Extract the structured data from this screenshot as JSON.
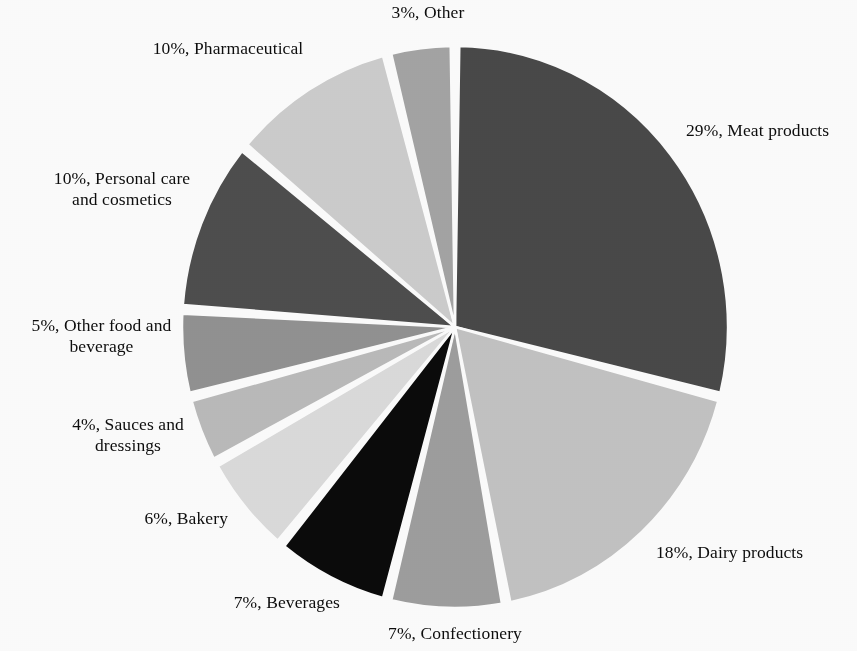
{
  "chart_data": {
    "type": "pie",
    "title": "",
    "subtitle": "",
    "xlabel": "",
    "ylabel": "",
    "legend_position": "none",
    "labels_outside": true,
    "label_format": "{percent}%, {category}",
    "start_angle_deg": 0,
    "direction": "clockwise",
    "categories": [
      "Meat products",
      "Dairy products",
      "Confectionery",
      "Beverages",
      "Bakery",
      "Sauces and dressings",
      "Other food and beverage",
      "Personal care and cosmetics",
      "Pharmaceutical",
      "Other"
    ],
    "values": [
      29,
      18,
      7,
      7,
      6,
      4,
      5,
      10,
      10,
      3
    ],
    "units": "percent",
    "total": 99,
    "slices": [
      {
        "index": 0,
        "category": "Meat products",
        "value": 29,
        "label": "29%, Meat products",
        "color": "#4a4a4a",
        "start_deg": 0,
        "end_deg": 104.4
      },
      {
        "index": 1,
        "category": "Dairy products",
        "value": 18,
        "label": "18%, Dairy products",
        "color": "#c5c5c5",
        "start_deg": 104.4,
        "end_deg": 169.2
      },
      {
        "index": 2,
        "category": "Confectionery",
        "value": 7,
        "label": "7%, Confectionery",
        "color": "#a0a0a0",
        "start_deg": 169.2,
        "end_deg": 194.4
      },
      {
        "index": 3,
        "category": "Beverages",
        "value": 7,
        "label": "7%, Beverages",
        "color": "#0b0b0b",
        "start_deg": 194.4,
        "end_deg": 219.6
      },
      {
        "index": 4,
        "category": "Bakery",
        "value": 6,
        "label": "6%, Bakery",
        "color": "#dedede",
        "start_deg": 219.6,
        "end_deg": 241.2
      },
      {
        "index": 5,
        "category": "Sauces and dressings",
        "value": 4,
        "label": "4%, Sauces and dressings",
        "color": "#bdbdbd",
        "start_deg": 241.2,
        "end_deg": 255.6
      },
      {
        "index": 6,
        "category": "Other food and beverage",
        "value": 5,
        "label": "5%, Other food and beverage",
        "color": "#949494",
        "start_deg": 255.6,
        "end_deg": 273.6
      },
      {
        "index": 7,
        "category": "Personal care and cosmetics",
        "value": 10,
        "label": "10%, Personal care and cosmetics",
        "color": "#4f4f4f",
        "start_deg": 273.6,
        "end_deg": 309.6
      },
      {
        "index": 8,
        "category": "Pharmaceutical",
        "value": 10,
        "label": "10%, Pharmaceutical",
        "color": "#cfcfcf",
        "start_deg": 309.6,
        "end_deg": 345.6
      },
      {
        "index": 9,
        "category": "Other",
        "value": 3,
        "label": "3%, Other",
        "color": "#a6a6a6",
        "start_deg": 345.6,
        "end_deg": 360
      }
    ],
    "geometry": {
      "center_x": 455,
      "center_y": 327,
      "radius_x": 273,
      "radius_y": 281,
      "slice_gap_px": 4,
      "gap_color": "#ffffff"
    }
  },
  "labels": {
    "other": "3%, Other",
    "pharmaceutical": "10%, Pharmaceutical",
    "personal_care_line1": "10%, Personal care",
    "personal_care_line2": "and cosmetics",
    "other_food_line1": "5%, Other food and",
    "other_food_line2": "beverage",
    "sauces_line1": "4%, Sauces and",
    "sauces_line2": "dressings",
    "bakery": "6%, Bakery",
    "beverages": "7%, Beverages",
    "confectionery": "7%, Confectionery",
    "dairy": "18%, Dairy products",
    "meat": "29%, Meat products"
  }
}
